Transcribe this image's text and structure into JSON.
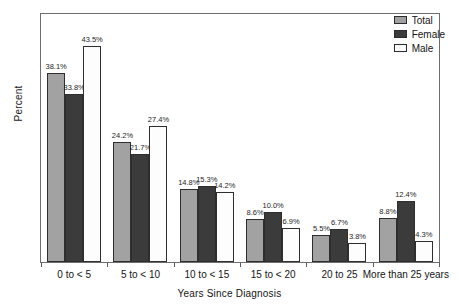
{
  "chart_data": {
    "type": "bar",
    "title": "",
    "xlabel": "Years Since Diagnosis",
    "ylabel": "Percent",
    "grid": false,
    "legend_position": "top-right",
    "ylim": [
      0,
      50
    ],
    "axis_tick_labels": [],
    "categories": [
      "0 to < 5",
      "5 to < 10",
      "10 to < 15",
      "15 to < 20",
      "20 to 25",
      "More than 25 years"
    ],
    "series": [
      {
        "name": "Total",
        "color": "#a2a2a2",
        "values": [
          38.1,
          24.2,
          14.8,
          8.6,
          5.5,
          8.8
        ],
        "labels": [
          "38.1%",
          "24.2%",
          "14.8%",
          "8.6%",
          "5.5%",
          "8.8%"
        ]
      },
      {
        "name": "Female",
        "color": "#3b3b3b",
        "values": [
          33.8,
          21.7,
          15.3,
          10.0,
          6.7,
          12.4
        ],
        "labels": [
          "33.8%",
          "21.7%",
          "15.3%",
          "10.0%",
          "6.7%",
          "12.4%"
        ]
      },
      {
        "name": "Male",
        "color": "#ffffff",
        "values": [
          43.5,
          27.4,
          14.2,
          6.9,
          3.8,
          4.3
        ],
        "labels": [
          "43.5%",
          "27.4%",
          "14.2%",
          "6.9%",
          "3.8%",
          "4.3%"
        ]
      }
    ]
  },
  "legend": {
    "items": [
      {
        "label": "Total"
      },
      {
        "label": "Female"
      },
      {
        "label": "Male"
      }
    ]
  }
}
